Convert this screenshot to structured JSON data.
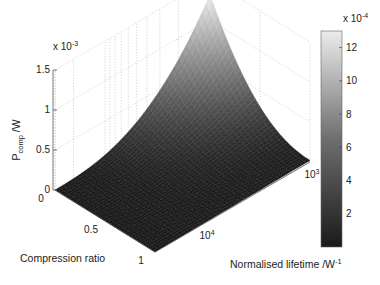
{
  "chart_data": {
    "type": "surface3d",
    "title": "",
    "xlabel": "Compression ratio",
    "ylabel": "Normalised lifetime /W^-1",
    "ylabel_main": "Normalised lifetime /W",
    "ylabel_sup": "-1",
    "zlabel_main": "P",
    "zlabel_sub": "comp",
    "zlabel_unit": " /W",
    "z_multiplier": "x 10",
    "z_multiplier_exp": "-3",
    "x_ticks": [
      "0",
      "0.5",
      "1"
    ],
    "x_range": [
      0,
      1
    ],
    "y_scale": "log",
    "y_ticks": [
      {
        "base": "10",
        "exp": "4"
      },
      {
        "base": "10",
        "exp": "3"
      }
    ],
    "y_range": [
      1000,
      30000
    ],
    "z_ticks": [
      "0",
      "0.5",
      "1",
      "1.5"
    ],
    "z_range": [
      0,
      0.0015
    ],
    "peak": {
      "compression_ratio": 0,
      "lifetime": 1000,
      "value": 0.0013
    },
    "corner_values": [
      {
        "compression_ratio": 0,
        "lifetime": 30000,
        "value": 0.0
      },
      {
        "compression_ratio": 1,
        "lifetime": 30000,
        "value": 0.0
      },
      {
        "compression_ratio": 1,
        "lifetime": 1000,
        "value": 2e-05
      },
      {
        "compression_ratio": 0,
        "lifetime": 1000,
        "value": 0.0013
      }
    ],
    "colormap": "gray",
    "colorbar": {
      "multiplier": "x 10",
      "multiplier_exp": "-4",
      "ticks": [
        "2",
        "4",
        "6",
        "8",
        "10",
        "12"
      ],
      "range": [
        0,
        13
      ]
    },
    "grid": true
  }
}
